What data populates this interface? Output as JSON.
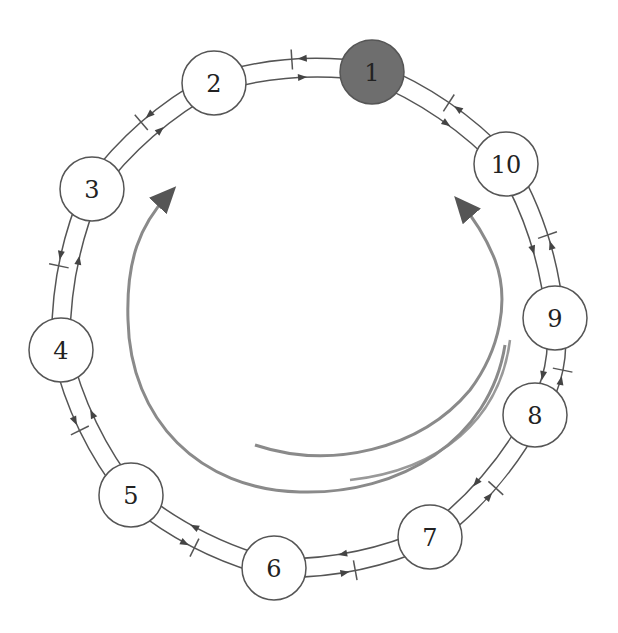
{
  "diagram": {
    "type": "bidirectional ring",
    "node_radius": 32,
    "colors": {
      "node_fill": "#ffffff",
      "highlight_fill": "#6e6e6e",
      "stroke": "#555555",
      "flow_arrow": "#8a8a8a"
    },
    "nodes": [
      {
        "id": "1",
        "label": "1",
        "x": 372,
        "y": 72,
        "highlighted": true
      },
      {
        "id": "2",
        "label": "2",
        "x": 214,
        "y": 83,
        "highlighted": false
      },
      {
        "id": "3",
        "label": "3",
        "x": 92,
        "y": 189,
        "highlighted": false
      },
      {
        "id": "4",
        "label": "4",
        "x": 61,
        "y": 350,
        "highlighted": false
      },
      {
        "id": "5",
        "label": "5",
        "x": 131,
        "y": 495,
        "highlighted": false
      },
      {
        "id": "6",
        "label": "6",
        "x": 274,
        "y": 568,
        "highlighted": false
      },
      {
        "id": "7",
        "label": "7",
        "x": 430,
        "y": 537,
        "highlighted": false
      },
      {
        "id": "8",
        "label": "8",
        "x": 535,
        "y": 415,
        "highlighted": false
      },
      {
        "id": "9",
        "label": "9",
        "x": 555,
        "y": 318,
        "highlighted": false
      },
      {
        "id": "10",
        "label": "10",
        "x": 506,
        "y": 164,
        "highlighted": false
      }
    ],
    "edges": [
      {
        "from": "1",
        "to": "2",
        "bidirectional": true
      },
      {
        "from": "2",
        "to": "3",
        "bidirectional": true
      },
      {
        "from": "3",
        "to": "4",
        "bidirectional": true
      },
      {
        "from": "4",
        "to": "5",
        "bidirectional": true
      },
      {
        "from": "5",
        "to": "6",
        "bidirectional": true
      },
      {
        "from": "6",
        "to": "7",
        "bidirectional": true
      },
      {
        "from": "7",
        "to": "8",
        "bidirectional": true
      },
      {
        "from": "8",
        "to": "9",
        "bidirectional": true
      },
      {
        "from": "9",
        "to": "10",
        "bidirectional": true
      },
      {
        "from": "10",
        "to": "1",
        "bidirectional": true
      }
    ],
    "flow_arrows": [
      {
        "direction": "counter-clockwise",
        "description": "inner arc rising on right side"
      },
      {
        "direction": "clockwise",
        "description": "outer arc rising on left side"
      }
    ]
  }
}
